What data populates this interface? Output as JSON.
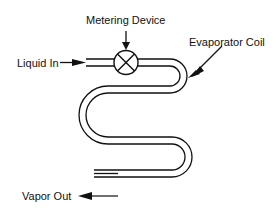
{
  "diagram": {
    "labels": {
      "metering_device": "Metering Device",
      "evaporator_coil": "Evaporator Coil",
      "liquid_in": "Liquid In",
      "vapor_out": "Vapor Out"
    },
    "colors": {
      "line": "#111111",
      "background": "#ffffff"
    },
    "icons": {
      "valve": "circle-with-x",
      "arrows": "filled-arrowheads"
    }
  }
}
